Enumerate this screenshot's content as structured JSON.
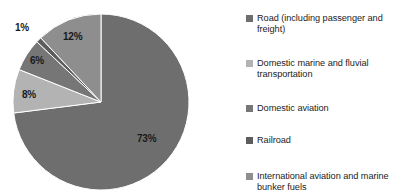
{
  "chart_data": {
    "type": "pie",
    "title": "",
    "subtitle": "",
    "xlabel": "",
    "ylabel": "",
    "grid": false,
    "legend_position": "right",
    "units": "percent",
    "start_angle_deg": 0,
    "direction": "clockwise",
    "categories": [
      "Road (including passenger and freight)",
      "Domestic marine and fluvial transportation",
      "Domestic aviation",
      "Railroad",
      "International aviation and marine bunker fuels"
    ],
    "values": [
      73,
      8,
      6,
      1,
      12
    ],
    "data_labels": [
      "73%",
      "8%",
      "6%",
      "1%",
      "12%"
    ],
    "colors": [
      "#6e6e6e",
      "#b3b3b3",
      "#767676",
      "#5d5d5d",
      "#8e8e8e"
    ]
  },
  "legend": {
    "items": [
      {
        "label": "Road (including passenger and freight)",
        "color": "#6e6e6e",
        "swatch_name": "legend-swatch-road"
      },
      {
        "label": "Domestic marine and fluvial transportation",
        "color": "#b3b3b3",
        "swatch_name": "legend-swatch-domestic-marine"
      },
      {
        "label": "Domestic aviation",
        "color": "#767676",
        "swatch_name": "legend-swatch-domestic-aviation"
      },
      {
        "label": "Railroad",
        "color": "#5d5d5d",
        "swatch_name": "legend-swatch-railroad"
      },
      {
        "label": "International aviation and marine bunker fuels",
        "color": "#8e8e8e",
        "swatch_name": "legend-swatch-international-aviation"
      }
    ]
  },
  "pie_labels": {
    "road": "73%",
    "domestic_marine": "8%",
    "domestic_aviation": "6%",
    "railroad": "1%",
    "international_aviation": "12%"
  }
}
